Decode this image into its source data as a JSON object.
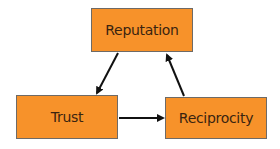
{
  "diagram": {
    "type": "cycle",
    "node_fill": "#f7922a",
    "node_border": "#6e6a66",
    "edge_color": "#111111",
    "nodes": [
      {
        "id": "reputation",
        "label": "Reputation"
      },
      {
        "id": "trust",
        "label": "Trust"
      },
      {
        "id": "reciprocity",
        "label": "Reciprocity"
      }
    ],
    "edges": [
      {
        "from": "reputation",
        "to": "trust"
      },
      {
        "from": "trust",
        "to": "reciprocity"
      },
      {
        "from": "reciprocity",
        "to": "reputation"
      }
    ]
  }
}
